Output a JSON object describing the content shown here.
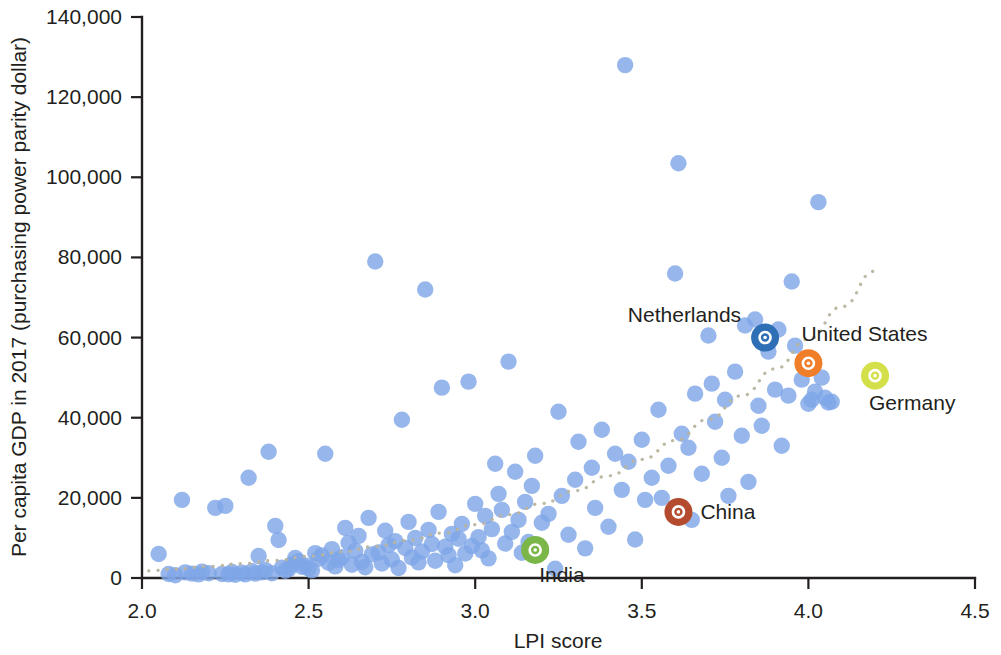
{
  "chart_data": {
    "type": "scatter",
    "title": "",
    "xlabel": "LPI score",
    "ylabel": "Per capita GDP in 2017 (purchasing power parity dollar)",
    "xlim": [
      2.0,
      4.5
    ],
    "ylim": [
      0,
      140000
    ],
    "xticks": [
      "2.0",
      "2.5",
      "3.0",
      "3.5",
      "4.0",
      "4.5"
    ],
    "xtick_values": [
      2.0,
      2.5,
      3.0,
      3.5,
      4.0,
      4.5
    ],
    "yticks": [
      "0",
      "20,000",
      "40,000",
      "60,000",
      "80,000",
      "100,000",
      "120,000",
      "140,000"
    ],
    "ytick_values": [
      0,
      20000,
      40000,
      60000,
      80000,
      100000,
      120000,
      140000
    ],
    "grid": false,
    "legend": "none",
    "point_color": "#7fa6e8",
    "trendline": {
      "style": "dotted",
      "color": "#b9b49d",
      "description": "upward curving dotted fit line from low-left to high-right",
      "points": [
        [
          2.02,
          1800
        ],
        [
          2.1,
          2200
        ],
        [
          2.2,
          2900
        ],
        [
          2.3,
          3600
        ],
        [
          2.4,
          4400
        ],
        [
          2.5,
          5400
        ],
        [
          2.6,
          6500
        ],
        [
          2.7,
          7900
        ],
        [
          2.8,
          9400
        ],
        [
          2.9,
          11200
        ],
        [
          3.0,
          13300
        ],
        [
          3.1,
          15800
        ],
        [
          3.2,
          18600
        ],
        [
          3.3,
          21800
        ],
        [
          3.4,
          25500
        ],
        [
          3.5,
          29600
        ],
        [
          3.6,
          34300
        ],
        [
          3.7,
          39600
        ],
        [
          3.8,
          45500
        ],
        [
          3.9,
          52200
        ],
        [
          4.0,
          59600
        ],
        [
          4.1,
          67700
        ],
        [
          4.2,
          76600
        ]
      ]
    },
    "highlighted": [
      {
        "name": "Netherlands",
        "x": 3.87,
        "y": 60000,
        "color": "#2f6fb5",
        "label_position": "left"
      },
      {
        "name": "United States",
        "x": 4.0,
        "y": 53600,
        "color": "#f07d28",
        "label_position": "right"
      },
      {
        "name": "Germany",
        "x": 4.2,
        "y": 50500,
        "color": "#d4e04a",
        "label_position": "below-right"
      },
      {
        "name": "China",
        "x": 3.61,
        "y": 16500,
        "color": "#b54b2e",
        "label_position": "right"
      },
      {
        "name": "India",
        "x": 3.18,
        "y": 7000,
        "color": "#7ab648",
        "label_position": "below-right"
      }
    ],
    "points": [
      [
        2.05,
        6000
      ],
      [
        2.08,
        1000
      ],
      [
        2.1,
        700
      ],
      [
        2.12,
        19500
      ],
      [
        2.13,
        1400
      ],
      [
        2.15,
        1100
      ],
      [
        2.17,
        900
      ],
      [
        2.18,
        1600
      ],
      [
        2.2,
        1200
      ],
      [
        2.22,
        17500
      ],
      [
        2.24,
        1000
      ],
      [
        2.25,
        18000
      ],
      [
        2.26,
        900
      ],
      [
        2.27,
        1500
      ],
      [
        2.28,
        800
      ],
      [
        2.3,
        1300
      ],
      [
        2.31,
        900
      ],
      [
        2.32,
        25000
      ],
      [
        2.33,
        1700
      ],
      [
        2.34,
        1100
      ],
      [
        2.35,
        5500
      ],
      [
        2.36,
        1400
      ],
      [
        2.37,
        2000
      ],
      [
        2.38,
        31500
      ],
      [
        2.39,
        1200
      ],
      [
        2.4,
        13000
      ],
      [
        2.41,
        9500
      ],
      [
        2.42,
        2600
      ],
      [
        2.43,
        1800
      ],
      [
        2.44,
        2200
      ],
      [
        2.45,
        3400
      ],
      [
        2.46,
        5000
      ],
      [
        2.47,
        4200
      ],
      [
        2.48,
        2800
      ],
      [
        2.49,
        3100
      ],
      [
        2.5,
        2400
      ],
      [
        2.51,
        1900
      ],
      [
        2.52,
        6200
      ],
      [
        2.53,
        4800
      ],
      [
        2.54,
        5600
      ],
      [
        2.55,
        31000
      ],
      [
        2.56,
        3800
      ],
      [
        2.57,
        7200
      ],
      [
        2.58,
        2900
      ],
      [
        2.59,
        4500
      ],
      [
        2.6,
        5200
      ],
      [
        2.61,
        12500
      ],
      [
        2.62,
        8800
      ],
      [
        2.63,
        3300
      ],
      [
        2.64,
        6800
      ],
      [
        2.65,
        10500
      ],
      [
        2.66,
        4000
      ],
      [
        2.67,
        2700
      ],
      [
        2.68,
        15000
      ],
      [
        2.69,
        5900
      ],
      [
        2.7,
        79000
      ],
      [
        2.71,
        6400
      ],
      [
        2.72,
        3600
      ],
      [
        2.73,
        11800
      ],
      [
        2.74,
        8200
      ],
      [
        2.75,
        4600
      ],
      [
        2.76,
        9200
      ],
      [
        2.77,
        2500
      ],
      [
        2.78,
        39500
      ],
      [
        2.79,
        7500
      ],
      [
        2.8,
        14000
      ],
      [
        2.81,
        5100
      ],
      [
        2.82,
        10000
      ],
      [
        2.83,
        3900
      ],
      [
        2.84,
        6600
      ],
      [
        2.85,
        72000
      ],
      [
        2.86,
        12000
      ],
      [
        2.87,
        8500
      ],
      [
        2.88,
        4300
      ],
      [
        2.89,
        16500
      ],
      [
        2.9,
        47500
      ],
      [
        2.91,
        7800
      ],
      [
        2.92,
        5700
      ],
      [
        2.93,
        11000
      ],
      [
        2.94,
        3200
      ],
      [
        2.95,
        9800
      ],
      [
        2.96,
        13500
      ],
      [
        2.97,
        6100
      ],
      [
        2.98,
        49000
      ],
      [
        2.99,
        8000
      ],
      [
        3.0,
        18500
      ],
      [
        3.01,
        10200
      ],
      [
        3.02,
        6900
      ],
      [
        3.03,
        15500
      ],
      [
        3.04,
        4900
      ],
      [
        3.05,
        12200
      ],
      [
        3.06,
        28500
      ],
      [
        3.07,
        21000
      ],
      [
        3.08,
        17000
      ],
      [
        3.09,
        8600
      ],
      [
        3.1,
        54000
      ],
      [
        3.11,
        11500
      ],
      [
        3.12,
        26500
      ],
      [
        3.13,
        14500
      ],
      [
        3.14,
        6300
      ],
      [
        3.15,
        19000
      ],
      [
        3.16,
        9000
      ],
      [
        3.17,
        23000
      ],
      [
        3.18,
        30500
      ],
      [
        3.2,
        13800
      ],
      [
        3.22,
        16000
      ],
      [
        3.24,
        2300
      ],
      [
        3.25,
        41500
      ],
      [
        3.26,
        20500
      ],
      [
        3.28,
        10800
      ],
      [
        3.3,
        24500
      ],
      [
        3.31,
        34000
      ],
      [
        3.33,
        7400
      ],
      [
        3.35,
        27500
      ],
      [
        3.36,
        17500
      ],
      [
        3.38,
        37000
      ],
      [
        3.4,
        12800
      ],
      [
        3.42,
        31000
      ],
      [
        3.44,
        22000
      ],
      [
        3.45,
        128000
      ],
      [
        3.46,
        29000
      ],
      [
        3.48,
        9600
      ],
      [
        3.5,
        34500
      ],
      [
        3.51,
        19500
      ],
      [
        3.53,
        25000
      ],
      [
        3.55,
        42000
      ],
      [
        3.56,
        20000
      ],
      [
        3.58,
        28000
      ],
      [
        3.6,
        76000
      ],
      [
        3.61,
        103500
      ],
      [
        3.62,
        36000
      ],
      [
        3.64,
        32500
      ],
      [
        3.65,
        14500
      ],
      [
        3.66,
        46000
      ],
      [
        3.68,
        26000
      ],
      [
        3.7,
        60500
      ],
      [
        3.71,
        48500
      ],
      [
        3.72,
        39000
      ],
      [
        3.74,
        30000
      ],
      [
        3.75,
        44500
      ],
      [
        3.76,
        20500
      ],
      [
        3.78,
        51500
      ],
      [
        3.8,
        35500
      ],
      [
        3.81,
        63000
      ],
      [
        3.82,
        24000
      ],
      [
        3.84,
        64500
      ],
      [
        3.85,
        43000
      ],
      [
        3.86,
        38000
      ],
      [
        3.88,
        56500
      ],
      [
        3.9,
        47000
      ],
      [
        3.91,
        62000
      ],
      [
        3.92,
        33000
      ],
      [
        3.94,
        45500
      ],
      [
        3.95,
        74000
      ],
      [
        3.96,
        58000
      ],
      [
        3.98,
        49500
      ],
      [
        4.0,
        43500
      ],
      [
        4.01,
        44500
      ],
      [
        4.02,
        46500
      ],
      [
        4.03,
        93800
      ],
      [
        4.04,
        50000
      ],
      [
        4.05,
        45000
      ],
      [
        4.06,
        43800
      ],
      [
        4.07,
        44000
      ]
    ]
  }
}
